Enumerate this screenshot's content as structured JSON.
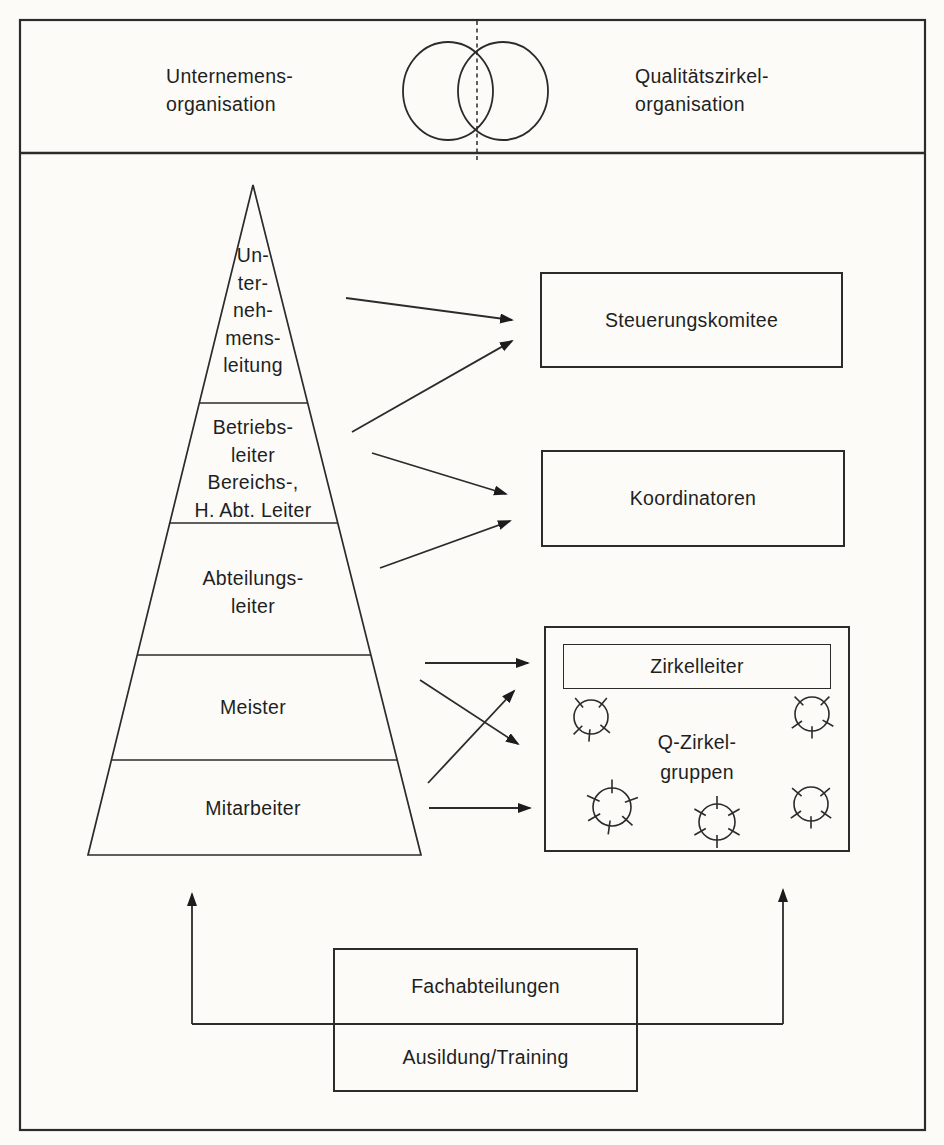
{
  "header": {
    "left": {
      "line1": "Unternemens-",
      "line2": "organisation"
    },
    "right": {
      "line1": "Qualitätszirkel-",
      "line2": "organisation"
    }
  },
  "pyramid": {
    "levels": [
      {
        "lines": [
          "Un-",
          "ter-",
          "neh-",
          "mens-",
          "leitung"
        ]
      },
      {
        "lines": [
          "Betriebs-",
          "leiter",
          "Bereichs-,",
          "H. Abt. Leiter"
        ]
      },
      {
        "lines": [
          "Abteilungs-",
          "leiter"
        ]
      },
      {
        "lines": [
          "Meister"
        ]
      },
      {
        "lines": [
          "Mitarbeiter"
        ]
      }
    ]
  },
  "right_column": {
    "steering_committee": "Steuerungskomitee",
    "coordinators": "Koordinatoren",
    "circle_leader": "Zirkelleiter",
    "q_circle_groups": {
      "line1": "Q-Zirkel-",
      "line2": "gruppen"
    }
  },
  "bottom": {
    "departments": "Fachabteilungen",
    "training": "Ausildung/Training"
  },
  "icons": {
    "venn": "two-overlapping-circles",
    "quality_circle": "circle-with-radial-ticks"
  },
  "colors": {
    "line": "#2b2b2b",
    "background": "#fcfbf8",
    "text": "#1f1f1f"
  }
}
